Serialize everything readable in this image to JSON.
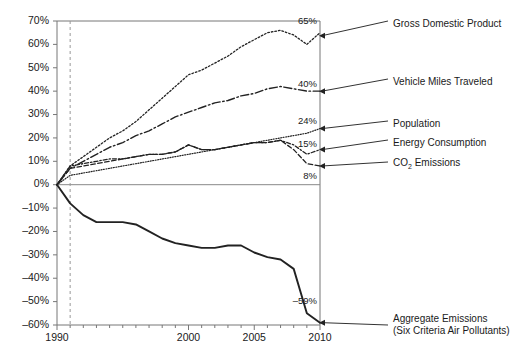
{
  "chart_data": {
    "type": "line",
    "title": "",
    "subtitle": "",
    "xlabel": "",
    "ylabel": "",
    "xlim": [
      1990,
      2010
    ],
    "ylim": [
      -60,
      70
    ],
    "ytick_step": 10,
    "grid": false,
    "legend_position": "right-inline-callouts",
    "yticks": [
      "70%",
      "60%",
      "50%",
      "40%",
      "30%",
      "20%",
      "10%",
      "0%",
      "–10%",
      "–20%",
      "–30%",
      "–40%",
      "–50%",
      "–60%"
    ],
    "ytick_values": [
      70,
      60,
      50,
      40,
      30,
      20,
      10,
      0,
      -10,
      -20,
      -30,
      -40,
      -50,
      -60
    ],
    "xticks": [
      "1990",
      "2000",
      "2005",
      "2010"
    ],
    "xtick_values": [
      1990,
      2000,
      2005,
      2010
    ],
    "xtick_minor_values": [
      1991,
      1992,
      1993,
      1994,
      1995,
      1996,
      1997,
      1998,
      1999,
      2001,
      2002,
      2003,
      2004,
      2006,
      2007,
      2008,
      2009
    ],
    "annotations": [
      {
        "name": "reference-line-1991",
        "type": "vline",
        "x": 1991,
        "style": "dashed"
      }
    ],
    "x": [
      1990,
      1991,
      1992,
      1993,
      1994,
      1995,
      1996,
      1997,
      1998,
      1999,
      2000,
      2001,
      2002,
      2003,
      2004,
      2005,
      2006,
      2007,
      2008,
      2009,
      2010
    ],
    "series": [
      {
        "name": "Gross Domestic Product",
        "key": "gdp",
        "style": "dotted",
        "end_label": "65%",
        "callout_label": "Gross Domestic Product",
        "values": [
          0,
          8,
          12,
          16,
          20,
          23,
          27,
          32,
          37,
          42,
          47,
          49,
          52,
          55,
          59,
          62,
          65,
          66,
          64,
          60,
          65
        ]
      },
      {
        "name": "Vehicle Miles Traveled",
        "key": "vmt",
        "style": "dash-dot",
        "end_label": "40%",
        "callout_label": "Vehicle Miles Traveled",
        "values": [
          0,
          7,
          10,
          13,
          16,
          18,
          21,
          23,
          26,
          29,
          31,
          33,
          35,
          36,
          38,
          39,
          41,
          42,
          41,
          40,
          40
        ]
      },
      {
        "name": "Population",
        "key": "population",
        "style": "fine-dotted",
        "end_label": "24%",
        "callout_label": "Population",
        "values": [
          0,
          4,
          5,
          6,
          7,
          8,
          9,
          10,
          11,
          12,
          13,
          14,
          15,
          16,
          17,
          18,
          19,
          20,
          21,
          22,
          24
        ]
      },
      {
        "name": "Energy Consumption",
        "key": "energy",
        "style": "dash-dot-short",
        "end_label": "15%",
        "callout_label": "Energy Consumption",
        "values": [
          0,
          8,
          9,
          10,
          11,
          11,
          12,
          13,
          13,
          14,
          17,
          15,
          15,
          16,
          17,
          18,
          18,
          19,
          17,
          13,
          15
        ]
      },
      {
        "name": "CO2 Emissions",
        "key": "co2",
        "style": "dashed",
        "end_label": "8%",
        "callout_label": "CO₂ Emissions",
        "values": [
          0,
          7,
          8,
          9,
          10,
          11,
          12,
          13,
          13,
          14,
          17,
          15,
          15,
          16,
          17,
          18,
          18,
          19,
          15,
          9,
          8
        ]
      },
      {
        "name": "Aggregate Emissions (Six Criteria Air Pollutants)",
        "key": "aggregate",
        "style": "solid",
        "end_label": "–59%",
        "callout_label_line1": "Aggregate Emissions",
        "callout_label_line2": "(Six Criteria Air Pollutants)",
        "values": [
          0,
          -8,
          -13,
          -16,
          -16,
          -16,
          -17,
          -20,
          -23,
          -25,
          -26,
          -27,
          -27,
          -26,
          -26,
          -29,
          -31,
          -32,
          -36,
          -55,
          -59
        ]
      }
    ]
  },
  "callouts": {
    "gdp": "Gross Domestic Product",
    "vmt": "Vehicle Miles Traveled",
    "population": "Population",
    "energy": "Energy Consumption",
    "co2_prefix": "CO",
    "co2_sub": "2",
    "co2_suffix": " Emissions",
    "aggregate_line1": "Aggregate Emissions",
    "aggregate_line2": "(Six Criteria Air Pollutants)"
  },
  "value_labels": {
    "gdp": "65%",
    "vmt": "40%",
    "population": "24%",
    "energy": "15%",
    "co2": "8%",
    "aggregate": "–59%"
  },
  "axis": {
    "y0": "70%",
    "y1": "60%",
    "y2": "50%",
    "y3": "40%",
    "y4": "30%",
    "y5": "20%",
    "y6": "10%",
    "y7": "0%",
    "y8": "–10%",
    "y9": "–20%",
    "y10": "–30%",
    "y11": "–40%",
    "y12": "–50%",
    "y13": "–60%",
    "x0": "1990",
    "x1": "2000",
    "x2": "2005",
    "x3": "2010"
  },
  "colors": {
    "ink": "#1a1a1a",
    "axis": "#6b6b6b",
    "line": "#222222",
    "reference": "#999999"
  }
}
